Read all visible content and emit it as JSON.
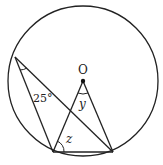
{
  "diagram": {
    "type": "circle-geometry",
    "circle": {
      "cx": 83,
      "cy": 81,
      "r": 75
    },
    "center_label": "O",
    "points": {
      "O": [
        83,
        81
      ],
      "A": [
        15,
        57
      ],
      "B": [
        53,
        152
      ],
      "C": [
        113,
        152
      ]
    },
    "segments": [
      [
        "A",
        "B"
      ],
      [
        "A",
        "C"
      ],
      [
        "B",
        "O"
      ],
      [
        "O",
        "C"
      ],
      [
        "B",
        "C"
      ]
    ],
    "angles": [
      {
        "label": "25°",
        "at": "A",
        "text_pos": [
          30,
          103
        ]
      },
      {
        "label": "y",
        "at": "O",
        "text_pos": [
          80,
          108
        ]
      },
      {
        "label": "z",
        "at": "B",
        "text_pos": [
          65,
          142
        ]
      }
    ]
  },
  "labels": {
    "center": "O",
    "angle_a": "25°",
    "angle_y": "y",
    "angle_z": "z"
  }
}
